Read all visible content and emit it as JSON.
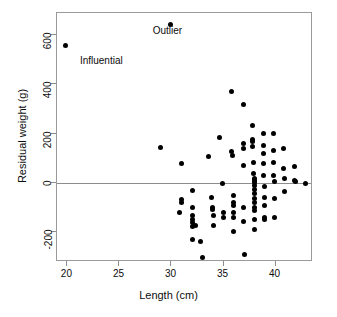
{
  "chart_data": {
    "type": "scatter",
    "title": "",
    "xlabel": "Length (cm)",
    "ylabel": "Residual weight (g)",
    "xlim": [
      19.0,
      43.6
    ],
    "ylim": [
      -320,
      690
    ],
    "xticks": [
      20,
      25,
      30,
      35,
      40
    ],
    "xtick_labels": [
      "20",
      "25",
      "30",
      "35",
      "40"
    ],
    "yticks": [
      -200,
      0,
      200,
      400,
      600
    ],
    "ytick_labels": [
      "-200",
      "0",
      "200",
      "400",
      "600"
    ],
    "grid": false,
    "legend": null,
    "reference_lines": [
      {
        "axis": "y",
        "value": 0,
        "color": "#8d8d8d"
      }
    ],
    "annotations": [
      {
        "text": "Influential",
        "x": 21.2,
        "y": 490
      },
      {
        "text": "Outlier",
        "x": 28.2,
        "y": 612
      }
    ],
    "points": [
      [
        19.8,
        558
      ],
      [
        29.9,
        645
      ],
      [
        28.9,
        143
      ],
      [
        31.0,
        80
      ],
      [
        31.0,
        -68
      ],
      [
        31.0,
        -78
      ],
      [
        30.8,
        -118
      ],
      [
        32.0,
        -28
      ],
      [
        32.0,
        -100
      ],
      [
        32.0,
        -132
      ],
      [
        32.0,
        -148
      ],
      [
        32.0,
        -160
      ],
      [
        32.0,
        -175
      ],
      [
        32.0,
        -228
      ],
      [
        32.3,
        -172
      ],
      [
        32.8,
        -238
      ],
      [
        33.0,
        -300
      ],
      [
        33.6,
        108
      ],
      [
        33.8,
        -58
      ],
      [
        33.9,
        -100
      ],
      [
        33.9,
        -108
      ],
      [
        34.0,
        -132
      ],
      [
        34.0,
        -172
      ],
      [
        34.6,
        186
      ],
      [
        34.9,
        0
      ],
      [
        35.0,
        -118
      ],
      [
        35.0,
        -138
      ],
      [
        35.8,
        372
      ],
      [
        35.8,
        128
      ],
      [
        35.9,
        112
      ],
      [
        36.0,
        -52
      ],
      [
        36.0,
        -80
      ],
      [
        36.0,
        -92
      ],
      [
        36.0,
        -120
      ],
      [
        36.0,
        -138
      ],
      [
        36.0,
        -196
      ],
      [
        36.9,
        320
      ],
      [
        36.9,
        160
      ],
      [
        36.9,
        142
      ],
      [
        36.9,
        70
      ],
      [
        36.9,
        -100
      ],
      [
        36.9,
        -156
      ],
      [
        37.0,
        -288
      ],
      [
        37.8,
        232
      ],
      [
        37.8,
        176
      ],
      [
        37.8,
        168
      ],
      [
        37.8,
        150
      ],
      [
        37.9,
        82
      ],
      [
        37.9,
        38
      ],
      [
        38.0,
        20
      ],
      [
        38.0,
        12
      ],
      [
        38.0,
        2
      ],
      [
        38.0,
        -10
      ],
      [
        38.0,
        -26
      ],
      [
        38.0,
        -44
      ],
      [
        38.0,
        -62
      ],
      [
        38.0,
        -80
      ],
      [
        38.0,
        -98
      ],
      [
        38.0,
        -112
      ],
      [
        38.0,
        -146
      ],
      [
        38.0,
        -190
      ],
      [
        38.8,
        200
      ],
      [
        38.8,
        152
      ],
      [
        38.8,
        120
      ],
      [
        38.8,
        78
      ],
      [
        38.8,
        30
      ],
      [
        38.9,
        -12
      ],
      [
        38.9,
        -60
      ],
      [
        38.9,
        -92
      ],
      [
        38.9,
        -140
      ],
      [
        38.9,
        -146
      ],
      [
        39.8,
        200
      ],
      [
        39.8,
        132
      ],
      [
        39.8,
        82
      ],
      [
        39.8,
        30
      ],
      [
        39.9,
        8
      ],
      [
        39.9,
        -62
      ],
      [
        39.9,
        -140
      ],
      [
        40.8,
        140
      ],
      [
        40.8,
        58
      ],
      [
        40.9,
        18
      ],
      [
        40.9,
        -34
      ],
      [
        41.8,
        68
      ],
      [
        41.8,
        12
      ],
      [
        41.9,
        8
      ],
      [
        42.9,
        0
      ]
    ]
  }
}
